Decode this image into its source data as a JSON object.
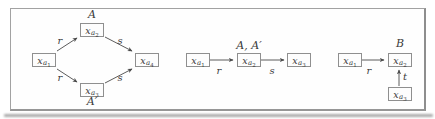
{
  "colors": {
    "frame_border": "#9a9a9a",
    "box_border": "#8f8f8f",
    "ink": "#3a3a3a",
    "arrow": "#4a4a4a",
    "background": "#ffffff"
  },
  "d1": {
    "nodes": {
      "n1": {
        "base": "x",
        "sub": "a",
        "subsub": "1"
      },
      "n2": {
        "base": "x",
        "sub": "a",
        "subsub": "2"
      },
      "n3": {
        "base": "x",
        "sub": "a",
        "subsub": "3"
      },
      "n4": {
        "base": "x",
        "sub": "a",
        "subsub": "4"
      }
    },
    "top_annotation": "A",
    "bottom_annotation": "A′",
    "edges": {
      "r_top": "r",
      "s_top": "s",
      "r_bottom": "r",
      "s_bottom": "s"
    }
  },
  "d2": {
    "nodes": {
      "n1": {
        "base": "x",
        "sub": "a",
        "subsub": "1"
      },
      "n2": {
        "base": "x",
        "sub": "a",
        "subsub": "2"
      },
      "n3": {
        "base": "x",
        "sub": "a",
        "subsub": "3"
      }
    },
    "top_annotation": "A, A′",
    "edges": {
      "r": "r",
      "s": "s"
    }
  },
  "d3": {
    "nodes": {
      "n1": {
        "base": "x",
        "sub": "a",
        "subsub": "1"
      },
      "n2": {
        "base": "x",
        "sub": "a",
        "subsub": "2"
      },
      "n3": {
        "base": "x",
        "sub": "a",
        "subsub": "3"
      }
    },
    "top_annotation": "B",
    "edges": {
      "r": "r",
      "t": "t"
    }
  }
}
